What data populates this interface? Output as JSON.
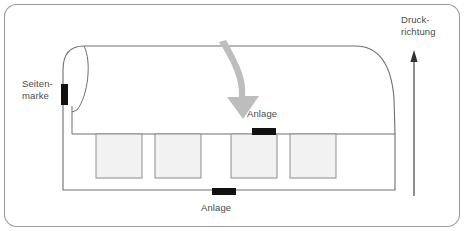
{
  "figure": {
    "width": 464,
    "height": 231,
    "frame": {
      "stroke": "#9b9b9b",
      "radius": 12,
      "fill": "#ffffff"
    }
  },
  "labels": {
    "seitenmarke": "Seiten-\nmarke",
    "druckrichtung": "Druck-\nrichtung",
    "anlage_top": "Anlage",
    "anlage_bottom": "Anlage"
  },
  "markers": {
    "seitenmarke_bar": {
      "orientation": "vertical",
      "color": "#111111",
      "x": 64,
      "y": 84,
      "w": 6,
      "h": 20
    },
    "anlage_top_bar": {
      "orientation": "horizontal",
      "color": "#111111",
      "x": 252,
      "y": 127,
      "w": 23,
      "h": 7
    },
    "anlage_bottom_bar": {
      "orientation": "horizontal",
      "color": "#111111",
      "x": 212,
      "y": 190,
      "w": 23,
      "h": 7
    }
  },
  "sheet": {
    "stroke": "#6e6e6e",
    "fill": "#ffffff",
    "top_edge_y": 46,
    "bottom_edge_y": 190,
    "left_x": 63,
    "right_x": 395
  },
  "print_boxes": {
    "count": 4,
    "fill": "#f2f2f2",
    "stroke": "#8d8d8d",
    "top": 134,
    "height": 44,
    "items": [
      {
        "x": 96,
        "w": 46
      },
      {
        "x": 155,
        "w": 46
      },
      {
        "x": 231,
        "w": 46
      },
      {
        "x": 290,
        "w": 46
      }
    ]
  },
  "flow_arrow": {
    "color": "#bdbdbd",
    "direction": "down",
    "description": "curved-grey-arrow"
  },
  "direction_arrow": {
    "color": "#333333",
    "direction": "up",
    "x": 414,
    "y_top": 52,
    "y_bottom": 196
  },
  "colors": {
    "frame_stroke": "#9b9b9b",
    "sheet_stroke": "#6e6e6e",
    "box_fill": "#f2f2f2",
    "box_stroke": "#8d8d8d",
    "marker_black": "#111111",
    "arrow_grey": "#bdbdbd",
    "text": "#4a4a4a"
  }
}
